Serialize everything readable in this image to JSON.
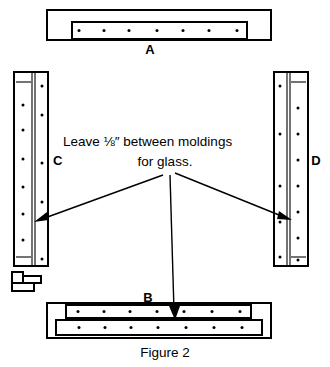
{
  "figure": {
    "caption": "Figure 2",
    "callout": {
      "line1": "Leave ⅛″ between moldings",
      "line2": "for glass."
    },
    "parts": [
      {
        "id": "A",
        "label": "A",
        "orientation": "horizontal",
        "position": "top",
        "nail_rows": 1,
        "nails_per_row": 7,
        "description": "top frame rail with inset molding strip"
      },
      {
        "id": "C",
        "label": "C",
        "orientation": "vertical",
        "position": "left",
        "nail_rows": 2,
        "nails_per_row": 7,
        "description": "left frame stile with inset molding strip"
      },
      {
        "id": "D",
        "label": "D",
        "orientation": "vertical",
        "position": "right",
        "nail_rows": 2,
        "nails_per_row": 7,
        "description": "right frame stile with inset molding strip"
      },
      {
        "id": "B",
        "label": "B",
        "orientation": "horizontal",
        "position": "bottom",
        "nail_rows": 2,
        "nails_per_row": 7,
        "description": "bottom frame rail with two molding strips"
      }
    ],
    "detail_piece": {
      "name": "molding-cross-section",
      "description": "small L-shaped molding cross-section detail"
    },
    "leaders": [
      {
        "name": "leader-to-part-c",
        "target": "C"
      },
      {
        "name": "leader-to-part-d",
        "target": "D"
      },
      {
        "name": "leader-to-part-b",
        "target": "B"
      }
    ],
    "colors": {
      "ink": "#000000",
      "paper": "#ffffff"
    }
  }
}
